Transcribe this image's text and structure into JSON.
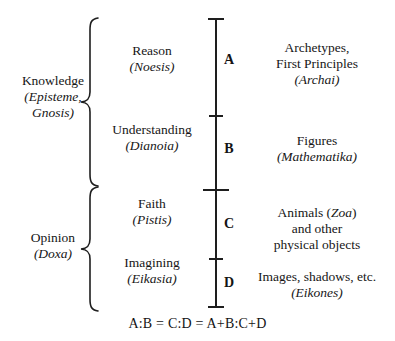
{
  "diagram": {
    "background_color": "#ffffff",
    "line_color": "#1e1e1e",
    "text_color": "#161616"
  },
  "domains": [
    {
      "id": "knowledge",
      "label": "Knowledge",
      "greek_line_1": "(Episteme,",
      "greek_line_2": "Gnosis)"
    },
    {
      "id": "opinion",
      "label": "Opinion",
      "greek_line_1": "(Doxa)"
    }
  ],
  "faculties": [
    {
      "id": "reason",
      "label": "Reason",
      "greek": "(Noesis)"
    },
    {
      "id": "understanding",
      "label": "Understanding",
      "greek": "(Dianoia)"
    },
    {
      "id": "faith",
      "label": "Faith",
      "greek": "(Pistis)"
    },
    {
      "id": "imagining",
      "label": "Imagining",
      "greek": "(Eikasia)"
    }
  ],
  "segments": [
    {
      "letter": "A",
      "object_line_1": "Archetypes,",
      "object_line_2": "First Principles",
      "greek": "(Archai)"
    },
    {
      "letter": "B",
      "object_line_1": "Figures",
      "greek": "(Mathematika)"
    },
    {
      "letter": "C",
      "object_line_1": "Animals (",
      "object_greek_inline": "Zoa",
      "object_line_1_tail": ")",
      "object_line_2": "and other",
      "object_line_3": "physical objects"
    },
    {
      "letter": "D",
      "object_line_1": "Images, shadows, etc.",
      "greek": "(Eikones)"
    }
  ],
  "formula": {
    "text": "A:B = C:D =  A+B:C+D"
  }
}
